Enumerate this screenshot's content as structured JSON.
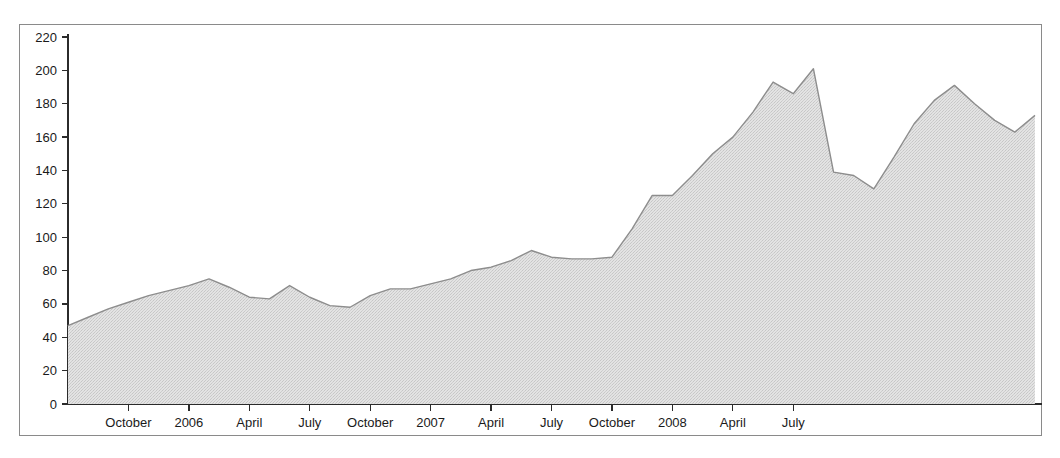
{
  "chart_data": {
    "type": "area",
    "title": "",
    "subtitle": "",
    "xlabel": "",
    "ylabel": "",
    "ylim": [
      0,
      220
    ],
    "ytick_step": 20,
    "yticks": [
      0,
      20,
      40,
      60,
      80,
      100,
      120,
      140,
      160,
      180,
      200,
      220
    ],
    "grid": false,
    "legend": null,
    "legend_position": "none",
    "fill_color": "#dcdcdc",
    "line_color": "#8d8d8d",
    "axis_color": "#2b2b2b",
    "background_color": "#ffffff",
    "xtick_labels": [
      "October",
      "2006",
      "April",
      "July",
      "October",
      "2007",
      "April",
      "July",
      "October",
      "2008",
      "April",
      "July"
    ],
    "xtick_positions_months": [
      3,
      6,
      9,
      12,
      15,
      18,
      21,
      24,
      27,
      30,
      33,
      36
    ],
    "x_start_label": "July 2005",
    "x_end_label": "September 2008",
    "x_months": [
      "2005-07",
      "2005-08",
      "2005-09",
      "2005-10",
      "2005-11",
      "2005-12",
      "2006-01",
      "2006-02",
      "2006-03",
      "2006-04",
      "2006-05",
      "2006-06",
      "2006-07",
      "2006-08",
      "2006-09",
      "2006-10",
      "2006-11",
      "2006-12",
      "2007-01",
      "2007-02",
      "2007-03",
      "2007-04",
      "2007-05",
      "2007-06",
      "2007-07",
      "2007-08",
      "2007-09",
      "2007-10",
      "2007-11",
      "2007-12",
      "2008-01",
      "2008-02",
      "2008-03",
      "2008-04",
      "2008-05",
      "2008-06",
      "2008-07",
      "2008-08",
      "2008-09"
    ],
    "values": [
      47,
      52,
      57,
      61,
      65,
      68,
      71,
      75,
      70,
      64,
      63,
      71,
      64,
      59,
      58,
      65,
      69,
      69,
      72,
      75,
      80,
      82,
      86,
      92,
      88,
      87,
      87,
      88,
      105,
      125,
      125,
      137,
      150,
      160,
      175,
      193,
      186,
      201,
      139
    ],
    "values_tail": [
      {
        "label": "2008-10",
        "value": 137
      },
      {
        "label": "2008-11",
        "value": 129
      },
      {
        "label": "2008-12",
        "value": 148
      },
      {
        "label": "2009-01",
        "value": 168
      },
      {
        "label": "2009-02",
        "value": 182
      },
      {
        "label": "2009-03",
        "value": 191
      },
      {
        "label": "2009-04",
        "value": 180
      },
      {
        "label": "2009-05",
        "value": 170
      },
      {
        "label": "2009-06",
        "value": 163
      },
      {
        "label": "2009-07",
        "value": 173
      }
    ],
    "series_points": [
      [
        0,
        47
      ],
      [
        1,
        52
      ],
      [
        2,
        57
      ],
      [
        3,
        61
      ],
      [
        4,
        65
      ],
      [
        5,
        68
      ],
      [
        6,
        71
      ],
      [
        7,
        75
      ],
      [
        8,
        70
      ],
      [
        9,
        64
      ],
      [
        10,
        63
      ],
      [
        11,
        71
      ],
      [
        12,
        64
      ],
      [
        13,
        59
      ],
      [
        14,
        58
      ],
      [
        15,
        65
      ],
      [
        16,
        69
      ],
      [
        17,
        69
      ],
      [
        18,
        72
      ],
      [
        19,
        75
      ],
      [
        20,
        80
      ],
      [
        21,
        82
      ],
      [
        22,
        86
      ],
      [
        23,
        92
      ],
      [
        24,
        88
      ],
      [
        25,
        87
      ],
      [
        26,
        87
      ],
      [
        27,
        88
      ],
      [
        28,
        105
      ],
      [
        29,
        125
      ],
      [
        30,
        125
      ],
      [
        31,
        137
      ],
      [
        32,
        150
      ],
      [
        33,
        160
      ],
      [
        34,
        175
      ],
      [
        35,
        193
      ],
      [
        36,
        186
      ],
      [
        37,
        201
      ],
      [
        38,
        139
      ],
      [
        39,
        137
      ],
      [
        40,
        129
      ],
      [
        41,
        148
      ],
      [
        42,
        168
      ],
      [
        43,
        182
      ],
      [
        44,
        191
      ],
      [
        45,
        180
      ],
      [
        46,
        170
      ],
      [
        47,
        163
      ],
      [
        48,
        173
      ]
    ],
    "notes": {
      "min_value": 47,
      "max_value": 201,
      "first_value": 47,
      "last_value": 173
    }
  },
  "figure": {
    "frame_border_color": "#8a8a8a",
    "plot_left": 68,
    "plot_right": 1035,
    "plot_top": 37,
    "plot_bottom": 404
  }
}
